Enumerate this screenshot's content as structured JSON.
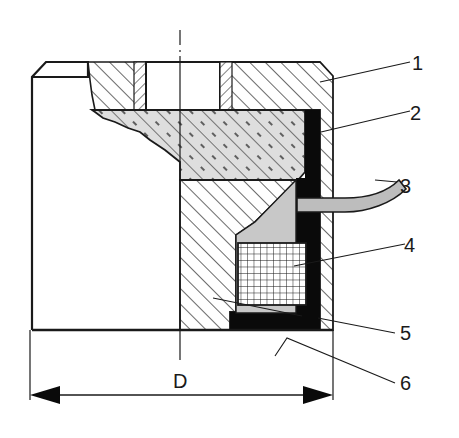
{
  "figure": {
    "type": "cross-section technical drawing",
    "colors": {
      "line": "#1a1a1a",
      "gray_fill": "#cfcfcf",
      "light_fill": "#e6e6e6",
      "black_fill": "#0a0a0a",
      "background": "#ffffff"
    }
  },
  "callouts": [
    {
      "id": "1",
      "label": "1"
    },
    {
      "id": "2",
      "label": "2"
    },
    {
      "id": "3",
      "label": "3"
    },
    {
      "id": "4",
      "label": "4"
    },
    {
      "id": "5",
      "label": "5"
    },
    {
      "id": "6",
      "label": "6"
    }
  ],
  "dimension": {
    "label": "D",
    "description": "overall diameter, arrows spanning full width"
  },
  "centerline": {
    "style": "dash-dot"
  }
}
